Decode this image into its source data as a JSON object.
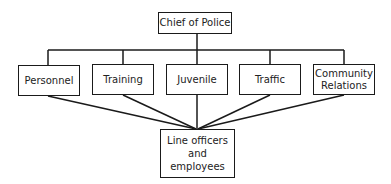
{
  "diagram": {
    "type": "org-chart",
    "top": {
      "label": "Chief of Police"
    },
    "divisions": [
      {
        "label": "Personnel"
      },
      {
        "label": "Training"
      },
      {
        "label": "Juvenile"
      },
      {
        "label": "Traffic"
      },
      {
        "label": "Community Relations",
        "lines": [
          "Community",
          "Relations"
        ]
      }
    ],
    "bottom": {
      "label": "Line officers and employees",
      "lines": [
        "Line officers",
        "and",
        "employees"
      ]
    }
  }
}
